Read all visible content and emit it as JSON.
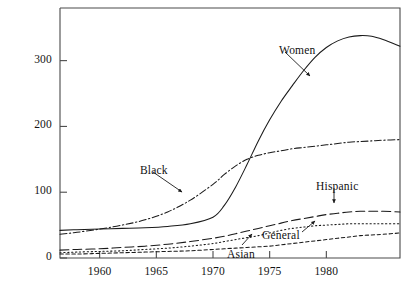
{
  "figure": {
    "background_color": "#ffffff",
    "axis_color": "#4a4a4a",
    "line_color": "#1a1a1a",
    "top_fragment_text": "population"
  },
  "axes": {
    "x": {
      "label": "",
      "ticks": [
        1960,
        1965,
        1970,
        1975,
        1980
      ],
      "tick_labels": [
        "1960",
        "1965",
        "1970",
        "1975",
        "1980"
      ],
      "range": [
        1956.5,
        1986.5
      ]
    },
    "y": {
      "label": "",
      "ticks": [
        0,
        100,
        200,
        300
      ],
      "tick_labels": [
        "0",
        "100",
        "200",
        "300"
      ],
      "range": [
        0,
        380
      ]
    }
  },
  "annotations": [
    {
      "name": "women",
      "text": "Women",
      "x": 279,
      "y": 44
    },
    {
      "name": "black",
      "text": "Black",
      "x": 140,
      "y": 164
    },
    {
      "name": "hispanic",
      "text": "Hispanic",
      "x": 316,
      "y": 180
    },
    {
      "name": "general",
      "text": "General",
      "x": 262,
      "y": 229
    },
    {
      "name": "asian",
      "text": "Asian",
      "x": 227,
      "y": 248
    }
  ],
  "chart_data": {
    "type": "line",
    "title": "",
    "xlabel": "",
    "ylabel": "",
    "xlim": [
      1956.5,
      1986.5
    ],
    "ylim": [
      0,
      380
    ],
    "grid": false,
    "legend_position": "inline-annotations",
    "x": [
      1956.5,
      1958,
      1960,
      1962,
      1964,
      1966,
      1968,
      1970,
      1971,
      1972,
      1973,
      1974,
      1975,
      1976,
      1977,
      1978,
      1979,
      1980,
      1981,
      1982,
      1983,
      1984,
      1985,
      1986.5
    ],
    "series": [
      {
        "name": "Women",
        "line_style": "solid",
        "values": [
          42,
          43,
          44,
          45,
          46,
          48,
          52,
          62,
          80,
          108,
          142,
          178,
          210,
          238,
          262,
          285,
          305,
          320,
          330,
          336,
          338,
          337,
          332,
          322
        ]
      },
      {
        "name": "Black",
        "line_style": "dash-dot",
        "values": [
          36,
          39,
          44,
          50,
          58,
          70,
          88,
          112,
          127,
          140,
          150,
          156,
          160,
          163,
          166,
          168,
          170,
          172,
          174,
          176,
          177,
          178,
          179,
          180
        ]
      },
      {
        "name": "Hispanic",
        "line_style": "long-dash",
        "values": [
          12,
          13,
          14,
          16,
          18,
          21,
          25,
          30,
          33,
          37,
          41,
          45,
          49,
          53,
          57,
          60,
          63,
          66,
          68,
          70,
          71,
          71,
          71,
          70
        ]
      },
      {
        "name": "General",
        "line_style": "dotted",
        "values": [
          8,
          9,
          10,
          11,
          13,
          15,
          18,
          22,
          25,
          28,
          31,
          34,
          38,
          42,
          45,
          47,
          49,
          50,
          51,
          52,
          52,
          52,
          52,
          52
        ]
      },
      {
        "name": "Asian",
        "line_style": "short-dash",
        "values": [
          6,
          6,
          7,
          8,
          9,
          10,
          11,
          13,
          14,
          15,
          16,
          17,
          18,
          20,
          22,
          24,
          26,
          28,
          30,
          32,
          34,
          35,
          36,
          38
        ]
      }
    ]
  }
}
